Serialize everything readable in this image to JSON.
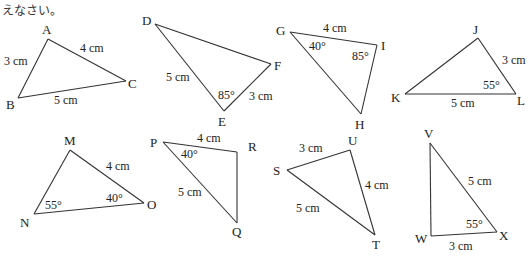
{
  "header": {
    "text": "えなさい。"
  },
  "triangles": [
    {
      "name": "ABC",
      "vertices": {
        "A": "A",
        "B": "B",
        "C": "C"
      },
      "labels": {
        "AB": "3 cm",
        "AC": "4 cm",
        "BC": "5 cm"
      }
    },
    {
      "name": "DEF",
      "vertices": {
        "D": "D",
        "E": "E",
        "F": "F"
      },
      "labels": {
        "DE": "5 cm",
        "EF": "3 cm",
        "angleE": "85°"
      }
    },
    {
      "name": "GHI",
      "vertices": {
        "G": "G",
        "H": "H",
        "I": "I"
      },
      "labels": {
        "GI": "4 cm",
        "angleG": "40°",
        "angleI": "85°"
      }
    },
    {
      "name": "JKL",
      "vertices": {
        "J": "J",
        "K": "K",
        "L": "L"
      },
      "labels": {
        "JL": "3 cm",
        "KL": "5 cm",
        "angleL": "55°"
      }
    },
    {
      "name": "MNO",
      "vertices": {
        "M": "M",
        "N": "N",
        "O": "O"
      },
      "labels": {
        "MO": "4 cm",
        "angleN": "55°",
        "angleO": "40°"
      }
    },
    {
      "name": "PQR",
      "vertices": {
        "P": "P",
        "Q": "Q",
        "R": "R"
      },
      "labels": {
        "PR": "4 cm",
        "PQ": "5 cm",
        "angleP": "40°"
      }
    },
    {
      "name": "STU",
      "vertices": {
        "S": "S",
        "T": "T",
        "U": "U"
      },
      "labels": {
        "SU": "3 cm",
        "UT": "4 cm",
        "ST": "5 cm"
      }
    },
    {
      "name": "VWX",
      "vertices": {
        "V": "V",
        "W": "W",
        "X": "X"
      },
      "labels": {
        "VX": "5 cm",
        "WX": "3 cm",
        "angleX": "55°"
      }
    }
  ]
}
